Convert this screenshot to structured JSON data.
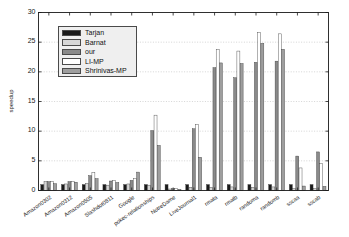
{
  "chart_data": {
    "type": "bar",
    "title": "",
    "xlabel": "",
    "ylabel": "speedup",
    "ylim": [
      0,
      30
    ],
    "ytick_labels": [
      "0",
      "5",
      "10",
      "15",
      "20",
      "25",
      "30"
    ],
    "ytick_values": [
      0,
      5,
      10,
      15,
      20,
      25,
      30
    ],
    "grid": true,
    "legend_position": "upper-left",
    "categories": [
      "Amazon0302",
      "Amazon0312",
      "Amazon0505",
      "Slashdot0811",
      "Google",
      "pokec-relationships",
      "NotreDame",
      "LiveJournal1",
      "rmata",
      "rmatb",
      "randoma",
      "randomb",
      "sscaa",
      "sscab"
    ],
    "series": [
      {
        "name": "Tarjan",
        "color": "#1a1a1a",
        "values": [
          1.0,
          1.0,
          1.0,
          1.0,
          1.0,
          1.0,
          1.0,
          1.0,
          1.0,
          1.0,
          1.0,
          1.0,
          1.0,
          1.0
        ]
      },
      {
        "name": "Barnat",
        "color": "#d6d6d6",
        "values": [
          1.5,
          1.1,
          1.2,
          0.9,
          1.1,
          0.9,
          0.25,
          0.55,
          0.55,
          0.6,
          0.55,
          0.6,
          0.35,
          0.35
        ]
      },
      {
        "name": "our",
        "color": "#8a8a8a",
        "values": [
          1.5,
          1.5,
          2.5,
          1.6,
          1.7,
          10.1,
          0.3,
          10.4,
          20.7,
          19.0,
          21.6,
          21.8,
          5.8,
          6.5
        ]
      },
      {
        "name": "LI-MP",
        "color": "#ffffff",
        "values": [
          1.55,
          1.5,
          3.0,
          1.7,
          2.0,
          12.7,
          0.32,
          11.1,
          23.8,
          23.5,
          26.6,
          26.4,
          3.8,
          4.6
        ]
      },
      {
        "name": "Shrinivas-MP",
        "color": "#9e9e9e",
        "values": [
          1.15,
          1.4,
          2.0,
          1.35,
          3.1,
          7.6,
          0.2,
          5.6,
          21.5,
          21.4,
          24.8,
          23.8,
          0.75,
          0.7
        ]
      }
    ]
  },
  "legend": {
    "entries": [
      {
        "label": "Tarjan",
        "color": "#1a1a1a"
      },
      {
        "label": "Barnat",
        "color": "#d6d6d6"
      },
      {
        "label": "our",
        "color": "#8a8a8a"
      },
      {
        "label": "LI-MP",
        "color": "#ffffff"
      },
      {
        "label": "Shrinivas-MP",
        "color": "#9e9e9e"
      }
    ]
  }
}
